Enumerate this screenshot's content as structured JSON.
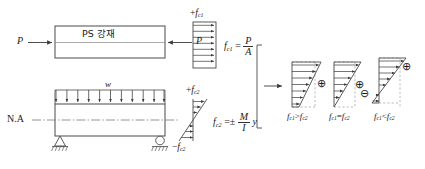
{
  "figure": {
    "stroke_color": "#444444",
    "fill_hatch_color": "#9a9a9a",
    "dashed_color": "#999999"
  },
  "top_beam": {
    "name": "prestress-beam",
    "tendon_label": "PS 강재",
    "force_left_label": "P",
    "force_right_label": "P"
  },
  "bottom_beam": {
    "name": "loaded-beam",
    "load_label": "w",
    "neutral_axis_label": "N.A",
    "arrow_count": 11,
    "left_support": "pin-support",
    "right_support": "roller-support"
  },
  "stress_block_axial": {
    "top_label_sign": "+",
    "top_label_symbol": "f",
    "top_label_sub": "c1",
    "arrow_count": 7,
    "formula": {
      "lhs_symbol": "f",
      "lhs_sub": "c1",
      "equals": "=",
      "numerator": "P",
      "denominator": "A"
    }
  },
  "stress_block_bending": {
    "top_label_sign": "+",
    "top_label_symbol": "f",
    "top_label_sub": "c2",
    "bottom_label_sign": "−",
    "bottom_label_symbol": "f",
    "bottom_label_sub": "c2",
    "formula": {
      "lhs_symbol": "f",
      "lhs_sub": "c2",
      "equals": "=",
      "plusminus": "±",
      "numerator": "M",
      "denominator": "I",
      "trailing": "y"
    }
  },
  "combined": {
    "bracket_arrow": "→",
    "cases": [
      {
        "id": "case-greater",
        "shape": "trapezoid",
        "signs": [
          "⊕"
        ],
        "label": {
          "left_symbol": "f",
          "left_sub": "c1",
          "operator": ">",
          "right_symbol": "f",
          "right_sub": "c2"
        }
      },
      {
        "id": "case-equal",
        "shape": "triangle",
        "signs": [
          "⊕"
        ],
        "label": {
          "left_symbol": "f",
          "left_sub": "c1",
          "operator": "=",
          "right_symbol": "f",
          "right_sub": "c2"
        }
      },
      {
        "id": "case-less",
        "shape": "triangle-with-tension",
        "signs": [
          "⊕",
          "⊖"
        ],
        "label": {
          "left_symbol": "f",
          "left_sub": "c1",
          "operator": "<",
          "right_symbol": "f",
          "right_sub": "c2"
        }
      }
    ]
  }
}
